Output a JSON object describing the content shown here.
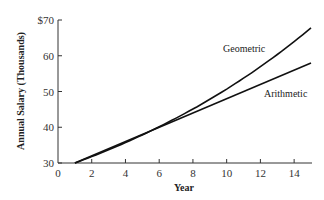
{
  "chart_data": {
    "type": "line",
    "title": "",
    "xlabel": "Year",
    "ylabel": "Annual Salary (Thousands)",
    "xlim": [
      0,
      15
    ],
    "ylim": [
      30,
      70
    ],
    "x_ticks": [
      "0",
      "2",
      "4",
      "6",
      "8",
      "10",
      "12",
      "14"
    ],
    "y_ticks": [
      "30",
      "40",
      "50",
      "60",
      "$70"
    ],
    "grid": false,
    "legend": "inline labels",
    "x": [
      1,
      3,
      5,
      7,
      9,
      11,
      13,
      15
    ],
    "series": [
      {
        "name": "Geometric",
        "values": [
          30.0,
          33.7,
          37.9,
          42.6,
          47.8,
          53.7,
          60.3,
          67.8
        ]
      },
      {
        "name": "Arithmetic",
        "values": [
          30,
          34,
          38,
          42,
          46,
          50,
          54,
          58
        ]
      }
    ],
    "annotations": [
      "Geometric",
      "Arithmetic"
    ]
  }
}
